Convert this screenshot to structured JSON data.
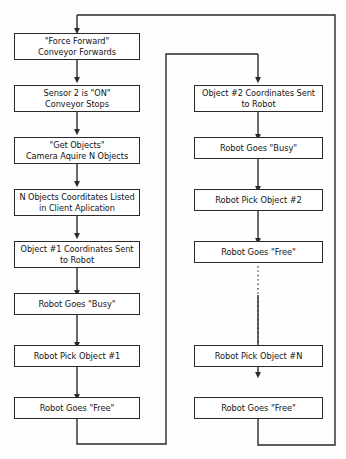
{
  "diagram": {
    "type": "flowchart",
    "orientation": "two-column-vertical",
    "line_color": "#2a2a2a",
    "box_fill": "#ffffff",
    "background": "#fefefe"
  },
  "left_column": {
    "nodes": [
      {
        "id": "force-forward",
        "label": "\"Force Forward\"\nConveyor Forwards",
        "lines": 2
      },
      {
        "id": "sensor-2-on",
        "label": "Sensor 2 is \"ON\"\nConveyor Stops",
        "lines": 2
      },
      {
        "id": "get-objects",
        "label": "\"Get Objects\"\nCamera Aquire N Objects",
        "lines": 2
      },
      {
        "id": "n-objects-listed",
        "label": "N Objects Coorditates Listed\nin Client Aplication",
        "lines": 2
      },
      {
        "id": "object-1-coordinates",
        "label": "Object #1 Coordinates Sent\nto Robot",
        "lines": 2
      },
      {
        "id": "robot-busy-1",
        "label": "Robot Goes \"Busy\"",
        "lines": 1
      },
      {
        "id": "robot-pick-1",
        "label": "Robot Pick Object #1",
        "lines": 1
      },
      {
        "id": "robot-free-1",
        "label": "Robot Goes \"Free\"",
        "lines": 1
      }
    ]
  },
  "right_column": {
    "nodes": [
      {
        "id": "object-2-coordinates",
        "label": "Object #2 Coordinates Sent\nto Robot",
        "lines": 2
      },
      {
        "id": "robot-busy-2",
        "label": "Robot Goes \"Busy\"",
        "lines": 1
      },
      {
        "id": "robot-pick-2",
        "label": "Robot Pick Object #2",
        "lines": 1
      },
      {
        "id": "robot-free-2",
        "label": "Robot Goes \"Free\"",
        "lines": 1
      },
      {
        "id": "robot-pick-n",
        "label": "Robot Pick Object #N",
        "lines": 1
      },
      {
        "id": "robot-free-n",
        "label": "Robot Goes \"Free\"",
        "lines": 1
      }
    ]
  },
  "connectors": {
    "dotted_ellipsis": "continuation between Object #2 and Object #N iterations",
    "left_loop": "Robot Goes \"Free\" (#1) feeds Object #2 Coordinates Sent to Robot",
    "right_loop": "Robot Goes \"Free\" (#N) returns to \"Force Forward\" Conveyor Forwards"
  }
}
